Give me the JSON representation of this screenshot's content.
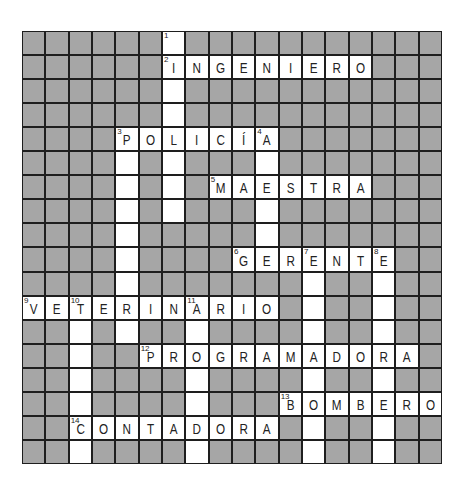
{
  "puzzle": {
    "rows": 18,
    "cols": 18,
    "colors": {
      "block": "#a6a6a6",
      "open": "#ffffff",
      "lines": "#1e1e1e"
    },
    "across": [
      {
        "number": "2",
        "row": 1,
        "col": 6,
        "answer": "INGENIERO"
      },
      {
        "number": "3",
        "row": 4,
        "col": 4,
        "answer": "POLICÍA"
      },
      {
        "number": "5",
        "row": 6,
        "col": 8,
        "answer": "MAESTRA"
      },
      {
        "number": "6",
        "row": 9,
        "col": 9,
        "answer": "GERENTE"
      },
      {
        "number": "9",
        "row": 11,
        "col": 0,
        "answer": "VETERINARIO"
      },
      {
        "number": "12",
        "row": 13,
        "col": 5,
        "answer": "PROGRAMADORA"
      },
      {
        "number": "13",
        "row": 15,
        "col": 11,
        "answer": "BOMBERO"
      },
      {
        "number": "14",
        "row": 16,
        "col": 2,
        "answer": "CONTADORA"
      }
    ],
    "down": [
      {
        "number": "1",
        "row": 0,
        "col": 6,
        "length": 8
      },
      {
        "number": "3",
        "row": 4,
        "col": 4,
        "length": 9
      },
      {
        "number": "4",
        "row": 4,
        "col": 10,
        "length": 6
      },
      {
        "number": "7",
        "row": 9,
        "col": 12,
        "length": 9
      },
      {
        "number": "8",
        "row": 9,
        "col": 15,
        "length": 9
      },
      {
        "number": "10",
        "row": 11,
        "col": 2,
        "length": 7
      },
      {
        "number": "11",
        "row": 11,
        "col": 7,
        "length": 7
      }
    ],
    "extra_numbers": [
      {
        "number": "4",
        "row": 4,
        "col": 10
      },
      {
        "number": "7",
        "row": 9,
        "col": 12
      },
      {
        "number": "8",
        "row": 9,
        "col": 15
      },
      {
        "number": "10",
        "row": 11,
        "col": 2
      },
      {
        "number": "11",
        "row": 11,
        "col": 7
      }
    ]
  }
}
